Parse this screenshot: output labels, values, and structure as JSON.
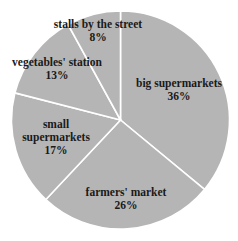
{
  "chart_data": {
    "type": "pie",
    "title": "",
    "start_angle_deg": 0,
    "direction": "clockwise",
    "fill_color": "#b5b5b5",
    "separator_color": "#ffffff",
    "categories": [
      "big supermarkets",
      "farmers' market",
      "small supermarkets",
      "vegetables' station",
      "stalls by the street"
    ],
    "values": [
      36,
      26,
      17,
      13,
      8
    ],
    "labels": [
      {
        "lines": [
          "big supermarkets",
          "36%"
        ],
        "x": 179,
        "y": 87
      },
      {
        "lines": [
          "farmers' market",
          "26%"
        ],
        "x": 126,
        "y": 196
      },
      {
        "lines": [
          "small",
          "supermarkets",
          "17%"
        ],
        "x": 56,
        "y": 128
      },
      {
        "lines": [
          "vegetables' station",
          "13%"
        ],
        "x": 57,
        "y": 66
      },
      {
        "lines": [
          "stalls by the street",
          "8%"
        ],
        "x": 98,
        "y": 28
      }
    ],
    "unit": "%"
  }
}
